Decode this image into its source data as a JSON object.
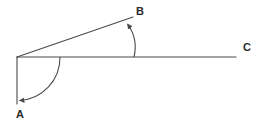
{
  "figure": {
    "type": "geometry-line-diagram",
    "canvas": {
      "width": 264,
      "height": 126,
      "background": "#ffffff"
    },
    "stroke_color": "#4a4a4a",
    "stroke_width": 1,
    "labels": {
      "a": "A",
      "b": "B",
      "c": "C"
    },
    "label_color": "#2b2b2b",
    "points": {
      "vertex": {
        "x": 17,
        "y": 57
      },
      "a_end": {
        "x": 17,
        "y": 104
      },
      "b_end": {
        "x": 133,
        "y": 17
      },
      "c_end": {
        "x": 236,
        "y": 57
      }
    },
    "rays": [
      {
        "name": "ray-to-a",
        "from": "vertex",
        "to": "a_end",
        "orientation": "vertical-down"
      },
      {
        "name": "ray-to-b",
        "from": "vertex",
        "to": "b_end",
        "orientation": "slanted-up-right"
      },
      {
        "name": "ray-to-c",
        "from": "vertex",
        "to": "c_end",
        "orientation": "horizontal-right"
      }
    ],
    "arcs": [
      {
        "name": "angle-arc-a",
        "description": "large arc sweeping from ray C to ray A, arrowhead at ray A",
        "radius": 43,
        "start": {
          "x": 60,
          "y": 57
        },
        "end": {
          "x": 19,
          "y": 100
        },
        "arrow_at": "end"
      },
      {
        "name": "angle-arc-b",
        "description": "small arc from ray C up to ray B, arrowhead at ray B",
        "radius": 40,
        "start": {
          "x": 134,
          "y": 57
        },
        "end": {
          "x": 127,
          "y": 23
        },
        "arrow_at": "end"
      }
    ]
  }
}
